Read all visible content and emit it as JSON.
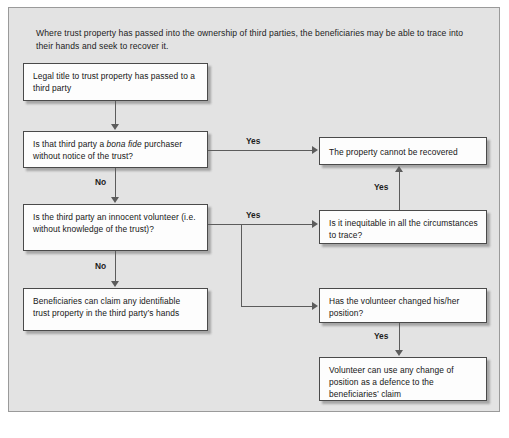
{
  "figure": {
    "caption": "Where trust property has passed into the ownership of third parties, the beneficiaries may be able to trace into their hands and seek to recover it.",
    "background_color": "#e3e3e3",
    "node_fill_color": "#fdfdfd",
    "node_border_color": "#4a4a4a",
    "connector_color": "#5c5c5c"
  },
  "nodes": {
    "start": "Legal title to trust property has passed to a third party",
    "bona_fide": {
      "part1": "Is that third party a ",
      "emphasis": "bona fide",
      "part2": " purchaser without notice of the trust?"
    },
    "innocent_volunteer": "Is the third party an innocent volunteer (i.e. without knowledge of the trust)?",
    "beneficiaries_claim": "Beneficiaries can claim any identifiable trust property in the third party’s hands",
    "cannot_recover": "The property cannot be recovered",
    "inequitable": "Is it inequitable in all the circumstances to trace?",
    "changed_position": "Has the volunteer changed his/her position?",
    "defence": "Volunteer can use any change of position as a defence to the beneficiaries’ claim"
  },
  "edge_labels": {
    "bona_fide_yes": "Yes",
    "bona_fide_no": "No",
    "volunteer_yes": "Yes",
    "volunteer_no": "No",
    "inequitable_yes": "Yes",
    "changed_position_yes": "Yes"
  }
}
